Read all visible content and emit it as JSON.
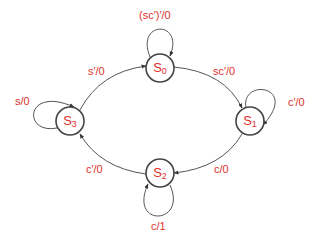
{
  "diagram": {
    "type": "state-machine",
    "colors": {
      "label": "#e0312b",
      "stroke": "#555555"
    },
    "states": [
      {
        "id": "S0",
        "base": "S",
        "sub": "0"
      },
      {
        "id": "S1",
        "base": "S",
        "sub": "1"
      },
      {
        "id": "S2",
        "base": "S",
        "sub": "2"
      },
      {
        "id": "S3",
        "base": "S",
        "sub": "3"
      }
    ],
    "transitions": [
      {
        "from": "S0",
        "to": "S0",
        "label": "(sc′)′/0"
      },
      {
        "from": "S0",
        "to": "S1",
        "label": "sc′/0"
      },
      {
        "from": "S1",
        "to": "S1",
        "label": "c′/0"
      },
      {
        "from": "S1",
        "to": "S2",
        "label": "c/0"
      },
      {
        "from": "S2",
        "to": "S2",
        "label": "c/1"
      },
      {
        "from": "S2",
        "to": "S3",
        "label": "c′/0"
      },
      {
        "from": "S3",
        "to": "S3",
        "label": "s/0"
      },
      {
        "from": "S3",
        "to": "S0",
        "label": "s′/0"
      }
    ]
  }
}
